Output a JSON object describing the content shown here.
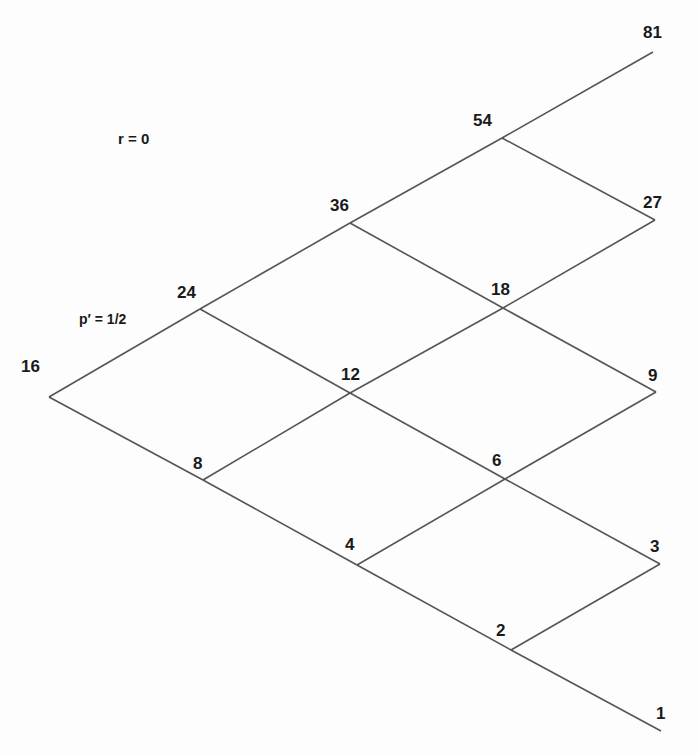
{
  "diagram": {
    "type": "binomial-tree",
    "annotations": {
      "rate": "r = 0",
      "probability": "p′ = 1/2"
    },
    "nodes": [
      {
        "id": "n16",
        "label": "16",
        "step": 0,
        "x": 49,
        "y": 397,
        "lx": 21,
        "ly": 358
      },
      {
        "id": "n24",
        "label": "24",
        "step": 1,
        "x": 200,
        "y": 309,
        "lx": 177,
        "ly": 284
      },
      {
        "id": "n8",
        "label": "8",
        "step": 1,
        "x": 203,
        "y": 480,
        "lx": 193,
        "ly": 455
      },
      {
        "id": "n36",
        "label": "36",
        "step": 2,
        "x": 350,
        "y": 223,
        "lx": 330,
        "ly": 197
      },
      {
        "id": "n12",
        "label": "12",
        "step": 2,
        "x": 350,
        "y": 393,
        "lx": 341,
        "ly": 366
      },
      {
        "id": "n4",
        "label": "4",
        "step": 2,
        "x": 357,
        "y": 565,
        "lx": 345,
        "ly": 536
      },
      {
        "id": "n54",
        "label": "54",
        "step": 3,
        "x": 502,
        "y": 138,
        "lx": 473,
        "ly": 112
      },
      {
        "id": "n18",
        "label": "18",
        "step": 3,
        "x": 503,
        "y": 308,
        "lx": 491,
        "ly": 281
      },
      {
        "id": "n6",
        "label": "6",
        "step": 3,
        "x": 505,
        "y": 479,
        "lx": 492,
        "ly": 452
      },
      {
        "id": "n2",
        "label": "2",
        "step": 3,
        "x": 511,
        "y": 650,
        "lx": 496,
        "ly": 622
      },
      {
        "id": "n81",
        "label": "81",
        "step": 4,
        "x": 653,
        "y": 52,
        "lx": 643,
        "ly": 24
      },
      {
        "id": "n27",
        "label": "27",
        "step": 4,
        "x": 655,
        "y": 220,
        "lx": 643,
        "ly": 194
      },
      {
        "id": "n9",
        "label": "9",
        "step": 4,
        "x": 656,
        "y": 392,
        "lx": 648,
        "ly": 367
      },
      {
        "id": "n3",
        "label": "3",
        "step": 4,
        "x": 660,
        "y": 564,
        "lx": 650,
        "ly": 538
      },
      {
        "id": "n1",
        "label": "1",
        "step": 4,
        "x": 661,
        "y": 731,
        "lx": 656,
        "ly": 705
      }
    ],
    "edges": [
      [
        "n16",
        "n24"
      ],
      [
        "n16",
        "n8"
      ],
      [
        "n24",
        "n36"
      ],
      [
        "n24",
        "n12"
      ],
      [
        "n8",
        "n12"
      ],
      [
        "n8",
        "n4"
      ],
      [
        "n36",
        "n54"
      ],
      [
        "n36",
        "n18"
      ],
      [
        "n12",
        "n18"
      ],
      [
        "n12",
        "n6"
      ],
      [
        "n4",
        "n6"
      ],
      [
        "n4",
        "n2"
      ],
      [
        "n54",
        "n81"
      ],
      [
        "n54",
        "n27"
      ],
      [
        "n18",
        "n27"
      ],
      [
        "n18",
        "n9"
      ],
      [
        "n6",
        "n9"
      ],
      [
        "n6",
        "n3"
      ],
      [
        "n2",
        "n3"
      ],
      [
        "n2",
        "n1"
      ]
    ],
    "colors": {
      "line": "#555555",
      "text": "#1a1a1a",
      "background": "#fdfdfd"
    }
  }
}
